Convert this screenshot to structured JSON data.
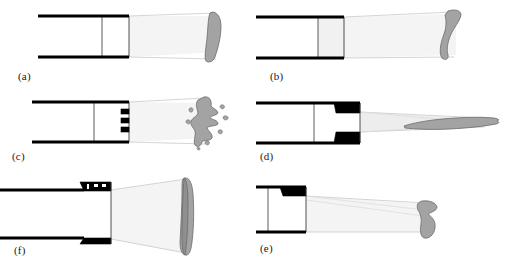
{
  "figure": {
    "title": "",
    "width": 511,
    "height": 274,
    "background": "#ffffff",
    "blob_color": "#a3a3a3",
    "blob_outline": "#6b6b6b",
    "wall_color": "#000000",
    "ray_color": "#c9c9c9",
    "block_color": "#000000"
  },
  "panels": [
    {
      "id": "a",
      "label": "(a)",
      "description": "straight duct, no obstruction, vertical elongated curved spray pattern",
      "exit_type": "open",
      "plume": "narrow-diverging",
      "pattern": "vertical-curved-band"
    },
    {
      "id": "b",
      "label": "(b)",
      "description": "straight duct with lightly shaded exit chamber, hook shaped spray pattern",
      "exit_type": "open-shaded",
      "plume": "diverging-downward",
      "pattern": "hook-comma"
    },
    {
      "id": "c",
      "label": "(c)",
      "description": "duct with three small rectangular obstacles at exit, fragmented spray pattern",
      "exit_type": "three-bar-grid",
      "plume": "narrow-diverging",
      "pattern": "fragmented-jagged",
      "obstacle_count": 3
    },
    {
      "id": "d",
      "label": "(d)",
      "description": "duct with converging wedge nozzle, long narrow elongated spray pattern",
      "exit_type": "converging-wedges",
      "plume": "narrow-jet",
      "pattern": "elongated-sliver"
    },
    {
      "id": "e",
      "label": "(e)",
      "description": "duct with single wedge on upper wall, downward deflected spray pattern",
      "exit_type": "single-top-wedge",
      "plume": "deflected-downward",
      "pattern": "compact-hook"
    },
    {
      "id": "f",
      "label": "(f)",
      "description": "duct with large trapezoidal blocks top and bottom, wide flared spray, large crescent pattern",
      "exit_type": "dual-large-blocks",
      "plume": "wide-flared",
      "pattern": "tall-crescent"
    }
  ]
}
